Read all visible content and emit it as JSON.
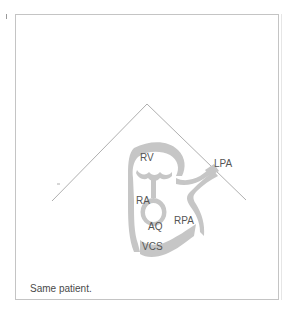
{
  "figure": {
    "caption": "Same patient.",
    "labels": {
      "rv": "RV",
      "ra": "RA",
      "aq": "AQ",
      "rpa": "RPA",
      "lpa": "LPA",
      "vcs": "VCS"
    },
    "colors": {
      "outline": "#9a9a9a",
      "structure_fill": "#c6c6c6",
      "frame": "#c4c4c4",
      "label_text": "#555555"
    }
  }
}
